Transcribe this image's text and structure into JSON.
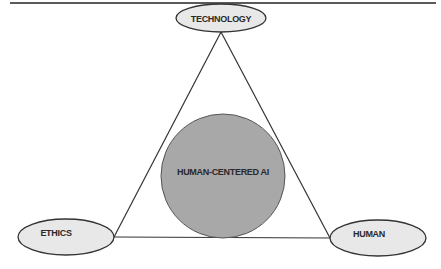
{
  "diagram": {
    "type": "triangle-with-center",
    "center": {
      "label": "HUMAN-CENTERED AI",
      "fill": "#a8a8a8"
    },
    "nodes": [
      {
        "id": "top",
        "label": "TECHNOLOGY",
        "fill": "#e8e8e8"
      },
      {
        "id": "left",
        "label": "ETHICS",
        "fill": "#e8e8e8"
      },
      {
        "id": "right",
        "label": "HUMAN",
        "fill": "#e8e8e8"
      }
    ],
    "edges": [
      [
        "TECHNOLOGY",
        "ETHICS"
      ],
      [
        "TECHNOLOGY",
        "HUMAN"
      ],
      [
        "ETHICS",
        "HUMAN"
      ]
    ],
    "colors": {
      "stroke": "#333333",
      "top_rule": "#555555",
      "background": "#ffffff"
    }
  }
}
